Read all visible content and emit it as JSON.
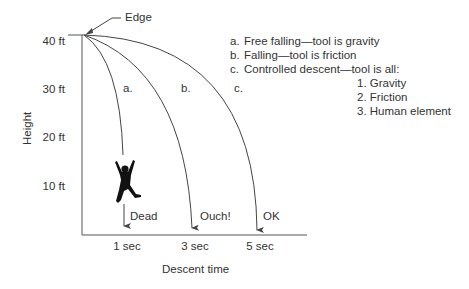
{
  "diagram": {
    "edge_label": "Edge",
    "y_axis": {
      "label": "Height",
      "ticks": [
        "40 ft",
        "30 ft",
        "20 ft",
        "10 ft"
      ]
    },
    "x_axis": {
      "label": "Descent time",
      "ticks": [
        "1 sec",
        "3 sec",
        "5 sec"
      ]
    },
    "curves": [
      {
        "letter": "a.",
        "outcome": "Dead"
      },
      {
        "letter": "b.",
        "outcome": "Ouch!"
      },
      {
        "letter": "c.",
        "outcome": "OK"
      }
    ],
    "legend": {
      "items": [
        {
          "letter": "a.",
          "text": "Free falling—tool is gravity"
        },
        {
          "letter": "b.",
          "text": "Falling—tool is friction"
        },
        {
          "letter": "c.",
          "text": "Controlled descent—tool is all:"
        }
      ],
      "sub_items": [
        "1. Gravity",
        "2. Friction",
        "3. Human element"
      ]
    },
    "figure": "falling-person-silhouette",
    "colors": {
      "line": "#444444",
      "text": "#333333",
      "figure": "#111111"
    }
  }
}
